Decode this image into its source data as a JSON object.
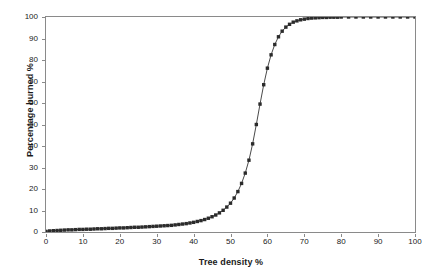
{
  "chart_data": {
    "type": "line",
    "title": "",
    "xlabel": "Tree density %",
    "ylabel": "Percentage burned %",
    "xlim": [
      0,
      100
    ],
    "ylim": [
      0,
      100
    ],
    "xticks": [
      0,
      10,
      20,
      30,
      40,
      50,
      60,
      70,
      80,
      90,
      100
    ],
    "yticks": [
      0,
      10,
      20,
      30,
      40,
      50,
      60,
      70,
      80,
      90,
      100
    ],
    "grid": false,
    "legend": null,
    "marker": "square",
    "marker_color": "#2b2b2b",
    "line_color": "#4a4a4a",
    "series": [
      {
        "name": "Percentage burned",
        "x": [
          0,
          1,
          2,
          3,
          4,
          5,
          6,
          7,
          8,
          9,
          10,
          11,
          12,
          13,
          14,
          15,
          16,
          17,
          18,
          19,
          20,
          21,
          22,
          23,
          24,
          25,
          26,
          27,
          28,
          29,
          30,
          31,
          32,
          33,
          34,
          35,
          36,
          37,
          38,
          39,
          40,
          41,
          42,
          43,
          44,
          45,
          46,
          47,
          48,
          49,
          50,
          51,
          52,
          53,
          54,
          55,
          56,
          57,
          58,
          59,
          60,
          61,
          62,
          63,
          64,
          65,
          66,
          67,
          68,
          69,
          70,
          71,
          72,
          73,
          74,
          75,
          76,
          77,
          78,
          79,
          80,
          82,
          84,
          86,
          88,
          90,
          92,
          94,
          96,
          98,
          100
        ],
        "values": [
          0.3,
          0.5,
          0.6,
          0.7,
          0.8,
          0.9,
          1.0,
          1.0,
          1.1,
          1.2,
          1.2,
          1.3,
          1.3,
          1.4,
          1.5,
          1.5,
          1.6,
          1.7,
          1.7,
          1.8,
          1.9,
          1.9,
          2.0,
          2.1,
          2.2,
          2.2,
          2.3,
          2.4,
          2.5,
          2.6,
          2.7,
          2.8,
          2.9,
          3.0,
          3.1,
          3.3,
          3.5,
          3.7,
          3.9,
          4.2,
          4.5,
          4.9,
          5.3,
          5.8,
          6.4,
          7.1,
          7.9,
          8.9,
          10.1,
          11.6,
          13.4,
          15.8,
          18.8,
          22.6,
          27.4,
          33.4,
          41.0,
          50.0,
          59.5,
          68.5,
          76.2,
          82.4,
          87.2,
          90.8,
          93.4,
          95.3,
          96.6,
          97.6,
          98.2,
          98.7,
          99.0,
          99.3,
          99.5,
          99.6,
          99.7,
          99.8,
          99.8,
          99.9,
          99.9,
          99.9,
          100.0,
          100.0,
          100.0,
          100.0,
          100.0,
          100.0,
          100.0,
          100.0,
          100.0,
          100.0,
          100.0
        ]
      }
    ],
    "annotations": []
  }
}
